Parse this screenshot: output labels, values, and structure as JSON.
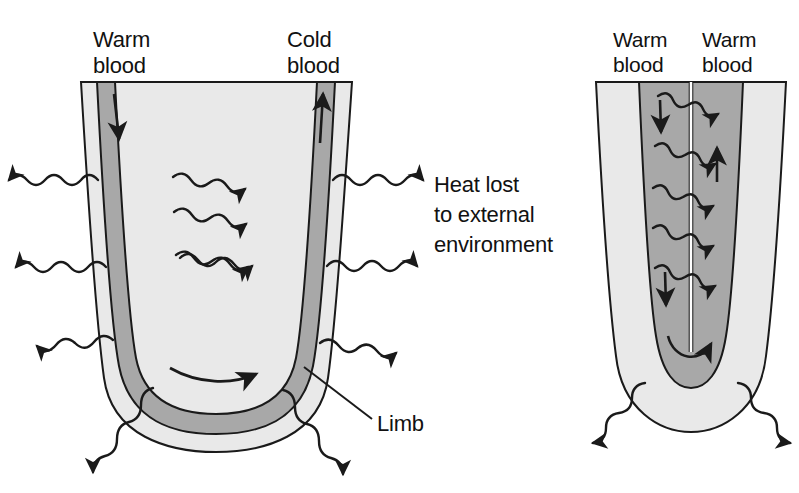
{
  "figure": {
    "type": "biological-diagram",
    "background_color": "#ffffff",
    "stroke_color": "#1a1a1a",
    "tissue_color": "#e9e9e9",
    "vessel_color": "#a8a8a8"
  },
  "left_panel": {
    "name": "limb-without-countercurrent-exchange",
    "labels": {
      "warm_blood": "Warm\nblood",
      "cold_blood": "Cold\nblood",
      "heat_lost": "Heat lost\nto external\nenvironment",
      "limb": "Limb"
    },
    "flow_arrows": [
      {
        "name": "descending-artery-arrow",
        "direction": "down"
      },
      {
        "name": "ascending-vein-arrow",
        "direction": "up"
      },
      {
        "name": "loop-bottom-arrow",
        "direction": "right"
      }
    ],
    "heat_arrow_counts": {
      "outward_left": 3,
      "outward_right": 3,
      "internal": 3,
      "bottom": 2
    }
  },
  "right_panel": {
    "name": "limb-with-countercurrent-exchange",
    "labels": {
      "warm_blood_artery": "Warm\nblood",
      "warm_blood_vein": "Warm\nblood"
    },
    "flow_arrows": [
      {
        "name": "descending-artery-arrow",
        "direction": "down"
      },
      {
        "name": "ascending-vein-arrow",
        "direction": "up"
      },
      {
        "name": "loop-bottom-arrow",
        "direction": "right"
      }
    ],
    "heat_arrow_counts": {
      "internal_transfer": 5,
      "bottom_outward": 2
    }
  }
}
